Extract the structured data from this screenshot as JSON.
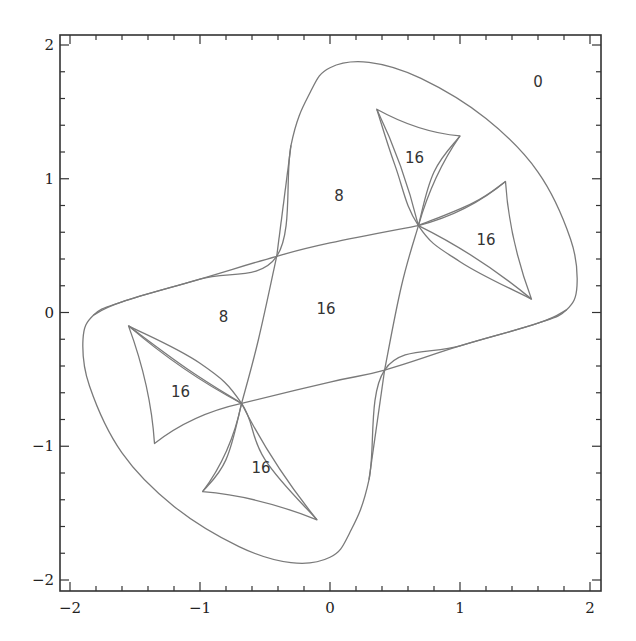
{
  "chart_data": {
    "type": "line",
    "title": "",
    "xlabel": "",
    "ylabel": "",
    "xlim": [
      -2.08,
      2.08
    ],
    "ylim": [
      -2.08,
      2.08
    ],
    "grid": false,
    "legend": null,
    "x_ticks": [
      {
        "value": -2,
        "label": "−2"
      },
      {
        "value": -1,
        "label": "−1"
      },
      {
        "value": 0,
        "label": "0"
      },
      {
        "value": 1,
        "label": "1"
      },
      {
        "value": 2,
        "label": "2"
      }
    ],
    "y_ticks": [
      {
        "value": 2,
        "label": "2"
      },
      {
        "value": 1,
        "label": "1"
      },
      {
        "value": 0,
        "label": "0"
      },
      {
        "value": -1,
        "label": "−1"
      },
      {
        "value": -2,
        "label": "−2"
      }
    ],
    "minor_tick_step": 0.2,
    "series": [
      {
        "name": "outer-boundary",
        "closed": true,
        "points": [
          [
            -0.41,
            0.42
          ],
          [
            -0.3,
            1.25
          ],
          [
            -0.15,
            1.65
          ],
          [
            0.0,
            1.83
          ],
          [
            0.3,
            1.87
          ],
          [
            0.7,
            1.75
          ],
          [
            1.2,
            1.45
          ],
          [
            1.6,
            1.05
          ],
          [
            1.85,
            0.55
          ],
          [
            1.9,
            0.2
          ],
          [
            1.82,
            0.02
          ],
          [
            1.6,
            -0.08
          ],
          [
            1.0,
            -0.25
          ],
          [
            0.42,
            -0.43
          ],
          [
            0.3,
            -1.25
          ],
          [
            0.15,
            -1.65
          ],
          [
            0.0,
            -1.83
          ],
          [
            -0.3,
            -1.87
          ],
          [
            -0.7,
            -1.75
          ],
          [
            -1.2,
            -1.45
          ],
          [
            -1.6,
            -1.05
          ],
          [
            -1.85,
            -0.55
          ],
          [
            -1.9,
            -0.2
          ],
          [
            -1.82,
            -0.02
          ],
          [
            -1.6,
            0.08
          ],
          [
            -1.0,
            0.25
          ],
          [
            -0.41,
            0.42
          ]
        ]
      },
      {
        "name": "inner-crossing-curve",
        "closed": true,
        "points": [
          [
            -0.41,
            0.42
          ],
          [
            0.0,
            0.52
          ],
          [
            0.68,
            0.65
          ],
          [
            1.0,
            0.8
          ],
          [
            1.35,
            0.98
          ],
          [
            1.55,
            0.1
          ],
          [
            1.0,
            0.35
          ],
          [
            0.68,
            0.65
          ],
          [
            0.42,
            -0.43
          ],
          [
            -0.68,
            -0.68
          ],
          [
            -1.0,
            -0.8
          ],
          [
            -1.35,
            -0.98
          ],
          [
            -1.55,
            -0.1
          ]
        ]
      },
      {
        "name": "cusp-triangle-upper-left",
        "closed": true,
        "points": [
          [
            0.36,
            1.52
          ],
          [
            1.0,
            1.32
          ],
          [
            0.68,
            0.65
          ]
        ]
      },
      {
        "name": "cusp-triangle-upper-right",
        "closed": true,
        "points": [
          [
            1.35,
            0.98
          ],
          [
            1.55,
            0.1
          ],
          [
            0.68,
            0.65
          ]
        ]
      },
      {
        "name": "cusp-triangle-lower-left",
        "closed": true,
        "points": [
          [
            -1.55,
            -0.1
          ],
          [
            -1.35,
            -0.98
          ],
          [
            -0.68,
            -0.68
          ]
        ]
      },
      {
        "name": "cusp-triangle-lower-right",
        "closed": true,
        "points": [
          [
            -0.98,
            -1.34
          ],
          [
            -0.1,
            -1.55
          ],
          [
            -0.68,
            -0.68
          ]
        ]
      }
    ],
    "annotations": [
      {
        "text": "0",
        "x": 1.6,
        "y": 1.72,
        "region": "outside"
      },
      {
        "text": "16",
        "x": 0.65,
        "y": 1.15,
        "region": "upper-left cusp"
      },
      {
        "text": "8",
        "x": 0.07,
        "y": 0.87,
        "region": "upper band"
      },
      {
        "text": "16",
        "x": 1.2,
        "y": 0.54,
        "region": "upper-right cusp"
      },
      {
        "text": "8",
        "x": -0.82,
        "y": -0.04,
        "region": "left band"
      },
      {
        "text": "16",
        "x": -0.03,
        "y": 0.02,
        "region": "central"
      },
      {
        "text": "16",
        "x": -1.15,
        "y": -0.6,
        "region": "lower-left cusp"
      },
      {
        "text": "16",
        "x": -0.53,
        "y": -1.17,
        "region": "lower-right cusp"
      }
    ]
  },
  "layout": {
    "frame_px": {
      "left": 60,
      "top": 35,
      "right": 601,
      "bottom": 591
    },
    "x_px": {
      "min_value": -2,
      "min_px": 70,
      "max_value": 2,
      "max_px": 590
    },
    "y_px": {
      "min_value": -2,
      "min_px": 580,
      "max_value": 2,
      "max_px": 45
    }
  }
}
